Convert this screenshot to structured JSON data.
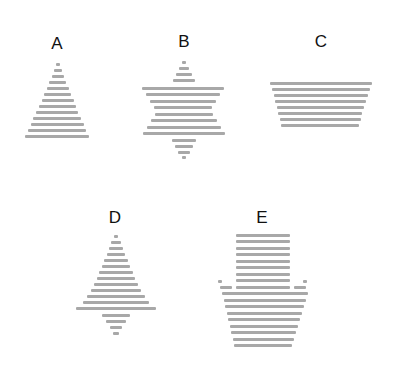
{
  "stripe_color": "#a8a8a8",
  "figures": [
    {
      "id": "A",
      "label": "A",
      "label_pos": [
        57,
        35
      ],
      "shape": "triangle",
      "stripes": [
        [
          56,
          63,
          4
        ],
        [
          54,
          69,
          8
        ],
        [
          52,
          75,
          12
        ],
        [
          49,
          81,
          17
        ],
        [
          47,
          87,
          22
        ],
        [
          44,
          93,
          27
        ],
        [
          42,
          99,
          32
        ],
        [
          39,
          105,
          37
        ],
        [
          36,
          111,
          42
        ],
        [
          33,
          117,
          48
        ],
        [
          31,
          123,
          53
        ],
        [
          28,
          129,
          58
        ],
        [
          25,
          135,
          64
        ]
      ]
    },
    {
      "id": "B",
      "label": "B",
      "label_pos": [
        184,
        33
      ],
      "shape": "six-pointed-star",
      "stripes": [
        [
          182,
          61,
          4
        ],
        [
          179,
          67,
          10
        ],
        [
          176,
          73,
          16
        ],
        [
          173,
          79,
          22
        ],
        [
          142,
          87,
          82
        ],
        [
          146,
          93,
          74
        ],
        [
          150,
          100,
          66
        ],
        [
          154,
          106,
          58
        ],
        [
          155,
          113,
          58
        ],
        [
          151,
          119,
          66
        ],
        [
          147,
          126,
          74
        ],
        [
          143,
          132,
          82
        ],
        [
          172,
          139,
          24
        ],
        [
          175,
          145,
          18
        ],
        [
          178,
          151,
          12
        ],
        [
          182,
          156,
          4
        ]
      ]
    },
    {
      "id": "C",
      "label": "C",
      "label_pos": [
        321,
        33
      ],
      "shape": "inverted-trapezoid",
      "stripes": [
        [
          270,
          82,
          102
        ],
        [
          272,
          88,
          98
        ],
        [
          274,
          94,
          94
        ],
        [
          275,
          100,
          91
        ],
        [
          277,
          106,
          87
        ],
        [
          278,
          112,
          84
        ],
        [
          280,
          118,
          81
        ],
        [
          281,
          124,
          78
        ]
      ]
    },
    {
      "id": "D",
      "label": "D",
      "label_pos": [
        115,
        209
      ],
      "shape": "kite",
      "stripes": [
        [
          114,
          235,
          4
        ],
        [
          111,
          241,
          10
        ],
        [
          109,
          247,
          14
        ],
        [
          107,
          253,
          18
        ],
        [
          104,
          259,
          24
        ],
        [
          102,
          265,
          28
        ],
        [
          99,
          271,
          34
        ],
        [
          97,
          277,
          38
        ],
        [
          94,
          283,
          44
        ],
        [
          91,
          289,
          50
        ],
        [
          87,
          295,
          58
        ],
        [
          83,
          301,
          66
        ],
        [
          76,
          307,
          80
        ],
        [
          102,
          314,
          28
        ],
        [
          106,
          320,
          20
        ],
        [
          110,
          326,
          12
        ],
        [
          113,
          332,
          6
        ]
      ]
    },
    {
      "id": "E",
      "label": "E",
      "label_pos": [
        262,
        209
      ],
      "shape": "house-arrow",
      "stripes": [
        [
          236,
          234,
          54
        ],
        [
          236,
          240,
          54
        ],
        [
          236,
          247,
          54
        ],
        [
          236,
          253,
          54
        ],
        [
          236,
          260,
          54
        ],
        [
          236,
          266,
          54
        ],
        [
          236,
          273,
          54
        ],
        [
          236,
          279,
          54
        ],
        [
          218,
          280,
          4
        ],
        [
          220,
          286,
          12
        ],
        [
          236,
          286,
          54
        ],
        [
          294,
          286,
          12
        ],
        [
          303,
          280,
          4
        ],
        [
          222,
          292,
          86
        ],
        [
          224,
          299,
          82
        ],
        [
          225,
          305,
          79
        ],
        [
          227,
          312,
          75
        ],
        [
          228,
          318,
          72
        ],
        [
          230,
          325,
          68
        ],
        [
          231,
          331,
          65
        ],
        [
          233,
          338,
          61
        ],
        [
          234,
          344,
          58
        ]
      ]
    }
  ]
}
